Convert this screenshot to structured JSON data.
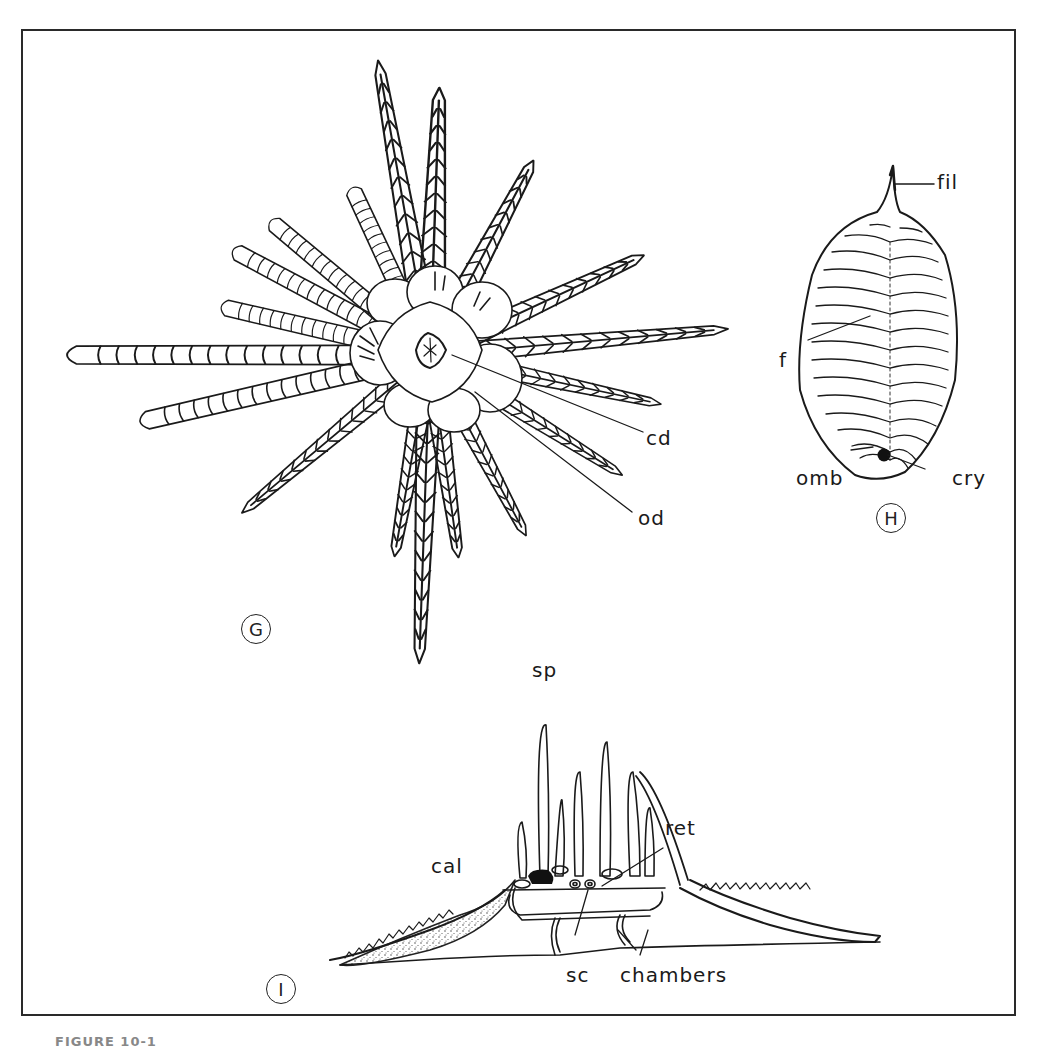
{
  "figure": {
    "caption_fragment": "FIGURE 10-1",
    "border_color": "#2a2a2a",
    "ink_color": "#1a1a1a"
  },
  "panels": [
    {
      "id": "G",
      "label": "G",
      "subject": "feather-star (crinoid) oral view with radiating pinnulate arms",
      "annotations": [
        {
          "key": "cd",
          "text": "cd"
        },
        {
          "key": "od",
          "text": "od"
        }
      ]
    },
    {
      "id": "H",
      "label": "H",
      "subject": "oval spiculate body with apical filament",
      "annotations": [
        {
          "key": "fil",
          "text": "fil"
        },
        {
          "key": "f",
          "text": "f"
        },
        {
          "key": "omb",
          "text": "omb"
        },
        {
          "key": "cry",
          "text": "cry"
        }
      ]
    },
    {
      "id": "I",
      "label": "I",
      "subject": "cross-section showing spines, calcified wings and internal chambers",
      "annotations": [
        {
          "key": "sp",
          "text": "sp"
        },
        {
          "key": "cal",
          "text": "cal"
        },
        {
          "key": "ret",
          "text": "ret"
        },
        {
          "key": "sc",
          "text": "sc"
        },
        {
          "key": "chambers",
          "text": "chambers"
        }
      ]
    }
  ]
}
